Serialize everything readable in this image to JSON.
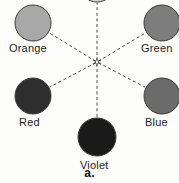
{
  "figure": {
    "caption": "a.",
    "caption_y": 166,
    "background": "#fdfdfc",
    "center": {
      "x": 97,
      "y": 62
    },
    "center_marker": "asterisk-star",
    "line_style": "dashed",
    "line_color": "#4a4a4a",
    "circle_outline": "#3a3a3a"
  },
  "nodes": [
    {
      "id": "yellow",
      "label": "",
      "cx": 97,
      "cy": -16,
      "r": 18,
      "fill": "#d6d6d6",
      "clipped": true,
      "label_x": 0,
      "label_y": 0
    },
    {
      "id": "orange",
      "label": "Orange",
      "cx": 33,
      "cy": 23,
      "r": 18,
      "fill": "#a8a8a8",
      "clipped": false,
      "label_x": 9,
      "label_y": 43
    },
    {
      "id": "green",
      "label": "Green",
      "cx": 162,
      "cy": 23,
      "r": 18,
      "fill": "#7d7d7d",
      "clipped": false,
      "label_x": 141,
      "label_y": 43
    },
    {
      "id": "red",
      "label": "Red",
      "cx": 33,
      "cy": 96,
      "r": 18,
      "fill": "#2e2e2e",
      "clipped": false,
      "label_x": 19,
      "label_y": 117
    },
    {
      "id": "blue",
      "label": "Blue",
      "cx": 162,
      "cy": 96,
      "r": 18,
      "fill": "#6b6b6b",
      "clipped": false,
      "label_x": 145,
      "label_y": 117
    },
    {
      "id": "violet",
      "label": "Violet",
      "cx": 97,
      "cy": 137,
      "r": 19,
      "fill": "#1a1a1a",
      "clipped": false,
      "label_x": 80,
      "label_y": 160
    }
  ],
  "spokes": [
    {
      "from": "center",
      "to": "yellow"
    },
    {
      "from": "center",
      "to": "orange"
    },
    {
      "from": "center",
      "to": "green"
    },
    {
      "from": "center",
      "to": "red"
    },
    {
      "from": "center",
      "to": "blue"
    },
    {
      "from": "center",
      "to": "violet"
    }
  ]
}
